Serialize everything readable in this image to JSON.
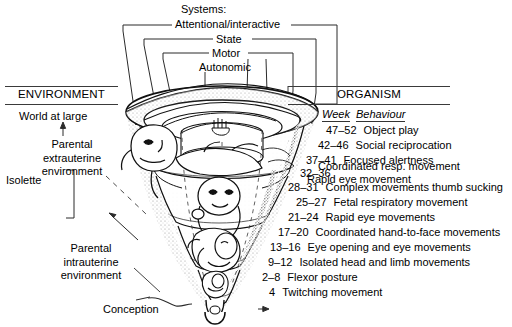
{
  "figure": {
    "systems": {
      "title": "Systems:",
      "levels": [
        {
          "label": "Attentional/interactive"
        },
        {
          "label": "State"
        },
        {
          "label": "Motor"
        },
        {
          "label": "Autonomic"
        }
      ]
    },
    "environment": {
      "heading": "ENVIRONMENT",
      "world": "World at large",
      "extrauterine": "Parental extrauterine environment",
      "isolette": "Isolette",
      "intrauterine": "Parental intrauterine environment",
      "conception": "Conception"
    },
    "organism": {
      "heading": "ORGANISM",
      "col_week": "Week",
      "col_behaviour": "Behaviour",
      "rows": [
        {
          "week": "47–52",
          "behaviour": "Object play"
        },
        {
          "week": "42–46",
          "behaviour": "Social reciprocation"
        },
        {
          "week": "37–41",
          "behaviour": "Focused alertness"
        },
        {
          "week": "32–36",
          "behaviour": "Rapid eye movement"
        },
        {
          "week": "",
          "behaviour": "Coordinated resp. movement"
        },
        {
          "week": "28–31",
          "behaviour": "Complex movements thumb sucking"
        },
        {
          "week": "25–27",
          "behaviour": "Fetal respiratory movement"
        },
        {
          "week": "21–24",
          "behaviour": "Rapid eye movements"
        },
        {
          "week": "17–20",
          "behaviour": "Coordinated hand-to-face movements"
        },
        {
          "week": "13–16",
          "behaviour": "Eye opening and eye movements"
        },
        {
          "week": "9–12",
          "behaviour": "Isolated head and limb movements"
        },
        {
          "week": "2–8",
          "behaviour": "Flexor posture"
        },
        {
          "week": "4",
          "behaviour": "Twitching movement",
          "arrow": "→"
        }
      ]
    },
    "colors": {
      "ink": "#000000",
      "rule": "#3a3a3a",
      "shade": "#9a9a9a",
      "background": "#ffffff"
    }
  }
}
